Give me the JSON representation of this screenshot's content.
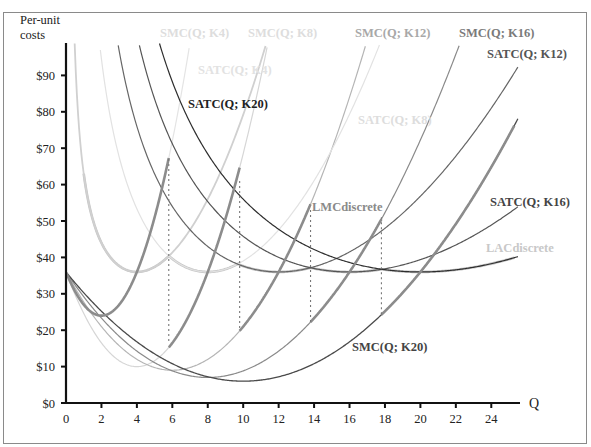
{
  "chart_data": {
    "type": "line",
    "title": "",
    "xlabel": "Q",
    "ylabel": "Per-unit costs",
    "ylabel_lines": [
      "Per-unit",
      "costs"
    ],
    "xlim": [
      0,
      25.5
    ],
    "ylim": [
      0,
      97
    ],
    "grid": false,
    "legend": "none (inline curve labels)",
    "x_ticks": [
      0,
      2,
      4,
      6,
      8,
      10,
      12,
      14,
      16,
      18,
      20,
      22,
      24
    ],
    "x_tick_labels": [
      "0",
      "2",
      "4",
      "6",
      "8",
      "10",
      "12",
      "14",
      "16",
      "18",
      "20",
      "22",
      "24"
    ],
    "y_ticks": [
      0,
      10,
      20,
      30,
      40,
      50,
      60,
      70,
      80,
      90
    ],
    "y_tick_labels": [
      "$0",
      "$10",
      "$20",
      "$30",
      "$40",
      "$50",
      "$60",
      "$70",
      "$80",
      "$90"
    ],
    "model": "SMC(Q;K) = 36 - K*b*Q + b*Q^2 ; SATC(Q;K) = (b*K^3/6)/Q + 36 - K*b*Q/2 + b*Q^2/3",
    "series": [
      {
        "name": "SMC(Q; K4)",
        "kind": "SMC",
        "K": 4,
        "b": 3.0,
        "min_point": [
          2,
          24
        ],
        "color": "#e4e4e4",
        "label_color": "#dddddd",
        "width": 1.2
      },
      {
        "name": "SMC(Q; K8)",
        "kind": "SMC",
        "K": 8,
        "b": 1.625,
        "min_point": [
          4,
          10
        ],
        "color": "#d6d6d6",
        "label_color": "#dddddd",
        "width": 1.2
      },
      {
        "name": "SMC(Q; K12)",
        "kind": "SMC",
        "K": 12,
        "b": 0.75,
        "min_point": [
          6,
          9
        ],
        "color": "#b5b5b5",
        "label_color": "#a8a8a8",
        "width": 1.2
      },
      {
        "name": "SMC(Q; K16)",
        "kind": "SMC",
        "K": 16,
        "b": 0.453,
        "min_point": [
          8,
          7
        ],
        "color": "#8a8a8a",
        "label_color": "#7a7a7a",
        "width": 1.2
      },
      {
        "name": "SMC(Q; K20)",
        "kind": "SMC",
        "K": 20,
        "b": 0.3,
        "min_point": [
          10,
          6
        ],
        "color": "#4a4a4a",
        "label_color": "#444444",
        "width": 1.3
      },
      {
        "name": "SATC(Q; K4)",
        "kind": "SATC",
        "K": 4,
        "b": 3.0,
        "min_point": [
          4,
          36
        ],
        "color": "#d0d0d0",
        "label_color": "#dddddd",
        "width": 1.8
      },
      {
        "name": "SATC(Q; K8)",
        "kind": "SATC",
        "K": 8,
        "b": 1.625,
        "min_point": [
          8,
          36
        ],
        "color": "#e2e2e2",
        "label_color": "#dddddd",
        "width": 1.2
      },
      {
        "name": "SATC(Q; K12)",
        "kind": "SATC",
        "K": 12,
        "b": 0.75,
        "min_point": [
          12,
          36
        ],
        "color": "#666666",
        "label_color": "#555555",
        "width": 1.2
      },
      {
        "name": "SATC(Q; K16)",
        "kind": "SATC",
        "K": 16,
        "b": 0.453,
        "min_point": [
          16,
          36
        ],
        "color": "#555555",
        "label_color": "#444444",
        "width": 1.2
      },
      {
        "name": "SATC(Q; K20)",
        "kind": "SATC",
        "K": 20,
        "b": 0.3,
        "min_point": [
          20,
          36
        ],
        "color": "#2e2e2e",
        "label_color": "#222222",
        "width": 1.2
      },
      {
        "name": "LACdiscrete",
        "kind": "envelope",
        "of": "SATC",
        "switch_points": [
          5.8,
          9.8,
          13.8,
          17.8
        ],
        "range": [
          1.0,
          25.3
        ],
        "color": "#c6c6c6",
        "label_color": "#c8c8c8",
        "width": 2.6
      },
      {
        "name": "LMCdiscrete",
        "kind": "envelope",
        "of": "SMC",
        "switch_points": [
          5.8,
          9.8,
          13.8,
          17.8
        ],
        "range": [
          0,
          25.3
        ],
        "color": "#8c8c8c",
        "label_color": "#8a8a8a",
        "width": 2.6
      }
    ],
    "switch_lines": [
      {
        "x": 5.8,
        "y_top": 67,
        "y_bottom": 17
      },
      {
        "x": 9.8,
        "y_top": 61,
        "y_bottom": 20
      },
      {
        "x": 13.8,
        "y_top": 53,
        "y_bottom": 22
      },
      {
        "x": 17.8,
        "y_top": 51,
        "y_bottom": 24
      }
    ],
    "annotations": [
      {
        "text": "SMC(Q; K4)",
        "x_px": 160,
        "y_px": 37,
        "color": "#dddddd"
      },
      {
        "text": "SMC(Q; K8)",
        "x_px": 248,
        "y_px": 37,
        "color": "#dddddd"
      },
      {
        "text": "SMC(Q; K12)",
        "x_px": 355,
        "y_px": 37,
        "color": "#a8a8a8"
      },
      {
        "text": "SMC(Q; K16)",
        "x_px": 459,
        "y_px": 37,
        "color": "#7a7a7a"
      },
      {
        "text": "SATC(Q; K12)",
        "x_px": 487,
        "y_px": 58,
        "color": "#555555"
      },
      {
        "text": "SATC(Q; K4)",
        "x_px": 198,
        "y_px": 74,
        "color": "#e2e2e2"
      },
      {
        "text": "SATC(Q; K20)",
        "x_px": 188,
        "y_px": 108,
        "color": "#222222"
      },
      {
        "text": "SATC(Q; K8)",
        "x_px": 358,
        "y_px": 124,
        "color": "#dddddd"
      },
      {
        "text": "LMCdiscrete",
        "x_px": 312,
        "y_px": 211,
        "color": "#8a8a8a"
      },
      {
        "text": "SATC(Q; K16)",
        "x_px": 490,
        "y_px": 206,
        "color": "#444444"
      },
      {
        "text": "LACdiscrete",
        "x_px": 486,
        "y_px": 252,
        "color": "#c8c8c8"
      },
      {
        "text": "SMC(Q; K20)",
        "x_px": 352,
        "y_px": 351,
        "color": "#444444"
      }
    ]
  }
}
